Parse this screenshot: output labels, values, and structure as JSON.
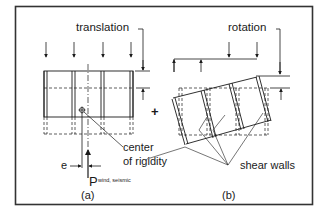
{
  "diagram": {
    "panel_a": {
      "title": "translation",
      "caption": "(a)",
      "eccentricity_label": "e",
      "load_label": "P",
      "load_subscript": "wind, seismic",
      "center_label_line1": "center",
      "center_label_line2": "of rigidity"
    },
    "panel_b": {
      "title": "rotation",
      "caption": "(b)",
      "shear_walls_label": "shear walls"
    },
    "combine_symbol": "+",
    "colors": {
      "ink": "#1a1a1a",
      "frame": "#333333",
      "background": "#ffffff"
    }
  }
}
